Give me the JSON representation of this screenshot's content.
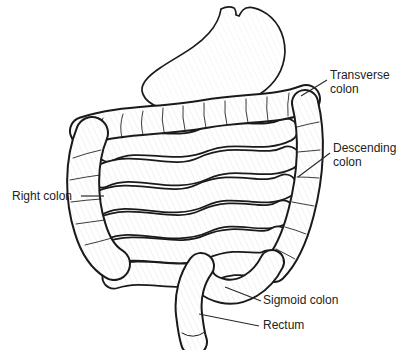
{
  "figure": {
    "description_parts": [
      "stomach",
      "transverse colon",
      "right colon",
      "descending colon",
      "small intestine",
      "sigmoid colon",
      "rectum"
    ],
    "colors": {
      "ink": "#1a1a1a",
      "background": "#ffffff",
      "label_text": "#222222"
    },
    "labels": [
      {
        "id": "transverse-colon",
        "lines": [
          "Transverse",
          "colon"
        ]
      },
      {
        "id": "descending-colon",
        "lines": [
          "Descending",
          "colon"
        ]
      },
      {
        "id": "right-colon",
        "lines": [
          "Right colon"
        ]
      },
      {
        "id": "sigmoid-colon",
        "lines": [
          "Sigmoid colon"
        ]
      },
      {
        "id": "rectum",
        "lines": [
          "Rectum"
        ]
      }
    ]
  }
}
